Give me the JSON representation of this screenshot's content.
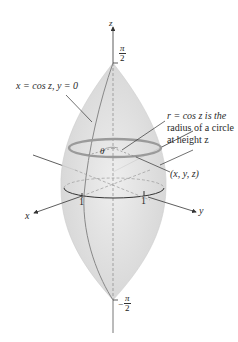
{
  "diagram": {
    "axes": {
      "z_label": "z",
      "x_label": "x",
      "y_label": "y",
      "z_top_tick": {
        "num": "π",
        "den": "2",
        "sign": ""
      },
      "z_bottom_tick": {
        "num": "π",
        "den": "2",
        "sign": "−"
      },
      "x_tick": "1",
      "y_tick": "1"
    },
    "annotations": {
      "curve_label": "x = cos z, y = 0",
      "radius_note_line1": "r = cos z is the",
      "radius_note_line2": "radius of a circle",
      "radius_note_line3": "at height z",
      "point_label": "(x, y, z)",
      "angle_label": "θ"
    },
    "colors": {
      "surface_fill": "#d9d9d9",
      "surface_edge": "#c4c4c4",
      "axis": "#333333",
      "circle": "#9a9a9a"
    }
  }
}
